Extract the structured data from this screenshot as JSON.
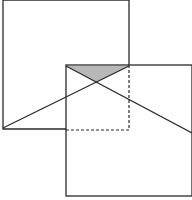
{
  "diagram": {
    "colors": {
      "stroke": "#2a2a2a",
      "shade": "#b8b8b8",
      "background": "#ffffff"
    },
    "square_upper_left": {
      "x1": 3,
      "y1": 0,
      "x2": 129,
      "y2": 129
    },
    "square_lower_right": {
      "x1": 66,
      "y1": 65,
      "x2": 192,
      "y2": 196
    },
    "overlap_dashed_edges": [
      {
        "x1": 129,
        "y1": 65,
        "x2": 129,
        "y2": 130
      },
      {
        "x1": 66,
        "y1": 130,
        "x2": 129,
        "y2": 130
      }
    ],
    "diagonals": [
      {
        "x1": 3,
        "y1": 128,
        "x2": 129,
        "y2": 66
      },
      {
        "x1": 66,
        "y1": 66,
        "x2": 192,
        "y2": 133
      }
    ],
    "shaded_triangle": [
      [
        66,
        66
      ],
      [
        129,
        66
      ],
      [
        97,
        82
      ]
    ]
  }
}
